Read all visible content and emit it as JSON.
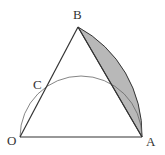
{
  "diagram": {
    "labels": {
      "O": "O",
      "A": "A",
      "B": "B",
      "C": "C"
    },
    "colors": {
      "line": "#333333",
      "thin_arc": "#555555",
      "shade": "#b8b8b8"
    },
    "elements": [
      "triangle OAB",
      "semicircle with diameter OA through C",
      "arc AB centered at O",
      "shaded region between chord AB and arc AB"
    ]
  }
}
